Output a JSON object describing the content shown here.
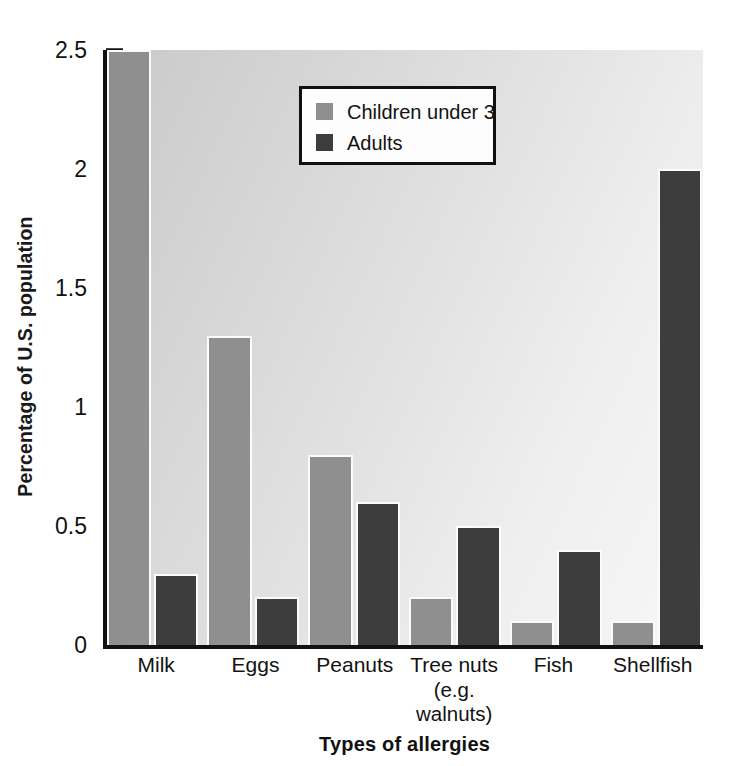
{
  "chart_data": {
    "type": "bar",
    "title": "",
    "xlabel": "Types of allergies",
    "ylabel": "Percentage of U.S. population",
    "ylim": [
      0,
      2.5
    ],
    "ytick_labels": [
      "0",
      "0.5",
      "1",
      "1.5",
      "2",
      "2.5"
    ],
    "ytick_values": [
      0,
      0.5,
      1,
      1.5,
      2,
      2.5
    ],
    "minor_tick_step": 0.1,
    "grid": false,
    "legend_position": "upper center",
    "categories": [
      "Milk",
      "Eggs",
      "Peanuts",
      "Tree nuts",
      "Fish",
      "Shellfish"
    ],
    "category_sublabels": [
      "",
      "",
      "",
      "(e.g. walnuts)",
      "",
      ""
    ],
    "series": [
      {
        "name": "Children under 3",
        "color": "#8f8f8f",
        "values": [
          2.5,
          1.3,
          0.8,
          0.2,
          0.1,
          0.1
        ]
      },
      {
        "name": "Adults",
        "color": "#3d3d3d",
        "values": [
          0.3,
          0.2,
          0.6,
          0.5,
          0.4,
          2.0
        ]
      }
    ]
  },
  "legend": {
    "entries": [
      {
        "label": "Children under 3",
        "swatch": "legend-swatch-children"
      },
      {
        "label": "Adults",
        "swatch": "legend-swatch-adults"
      }
    ]
  },
  "colors": {
    "children": "#8f8f8f",
    "adults": "#3d3d3d",
    "axis": "#111111",
    "plot_background_light": "#f7f7f7",
    "plot_background_dark": "#c9c9c9"
  }
}
